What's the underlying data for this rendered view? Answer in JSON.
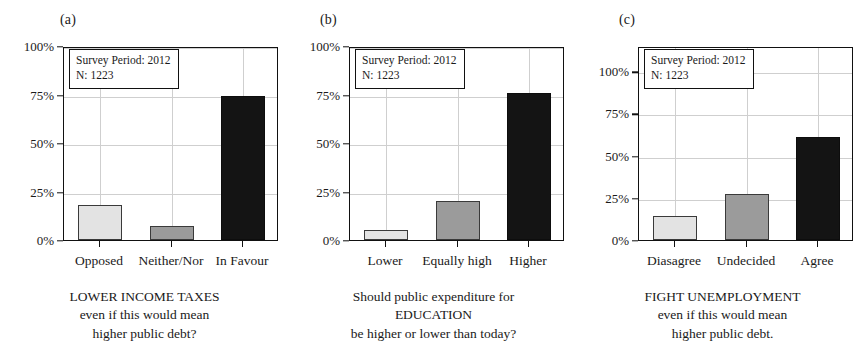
{
  "figure": {
    "panels": [
      {
        "letter": "(a)",
        "annotation": {
          "survey_period": "Survey Period: 2012",
          "n": "N: 1223"
        },
        "y_ticks": [
          "0%",
          "25%",
          "50%",
          "75%",
          "100%"
        ],
        "x_labels": [
          "Opposed",
          "Neither/Nor",
          "In Favour"
        ],
        "caption_lines": [
          "LOWER INCOME TAXES",
          "even if this would mean",
          "higher public debt?"
        ]
      },
      {
        "letter": "(b)",
        "annotation": {
          "survey_period": "Survey Period: 2012",
          "n": "N: 1223"
        },
        "y_ticks": [
          "0%",
          "25%",
          "50%",
          "75%",
          "100%"
        ],
        "x_labels": [
          "Lower",
          "Equally high",
          "Higher"
        ],
        "caption_lines": [
          "Should public expenditure for",
          "EDUCATION",
          "be higher or lower than today?"
        ]
      },
      {
        "letter": "(c)",
        "annotation": {
          "survey_period": "Survey Period: 2012",
          "n": "N: 1223"
        },
        "y_ticks": [
          "0%",
          "25%",
          "50%",
          "75%",
          "100%"
        ],
        "x_labels": [
          "Diasagree",
          "Undecided",
          "Agree"
        ],
        "caption_lines": [
          "FIGHT UNEMPLOYMENT",
          "even if this would mean",
          "higher public debt."
        ]
      }
    ],
    "colors": {
      "bar_light": "#e3e3e3",
      "bar_medium": "#9b9b9b",
      "bar_dark": "#141414",
      "frame": "#111111",
      "grid": "#cfcfcf",
      "text": "#1a1a1a",
      "background": "#ffffff"
    }
  },
  "chart_data": [
    {
      "type": "bar",
      "panel": "(a)",
      "title": "LOWER INCOME TAXES even if this would mean higher public debt?",
      "xlabel": "",
      "ylabel": "",
      "categories": [
        "Opposed",
        "Neither/Nor",
        "In Favour"
      ],
      "values": [
        18,
        7,
        74
      ],
      "bar_colors": [
        "#e3e3e3",
        "#9b9b9b",
        "#141414"
      ],
      "ylim": [
        0,
        100
      ],
      "yticks": [
        0,
        25,
        50,
        75,
        100
      ],
      "ytick_labels": [
        "0%",
        "25%",
        "50%",
        "75%",
        "100%"
      ],
      "grid": true,
      "legend": false,
      "annotations": [
        "Survey Period: 2012",
        "N: 1223"
      ]
    },
    {
      "type": "bar",
      "panel": "(b)",
      "title": "Should public expenditure for EDUCATION be higher or lower than today?",
      "xlabel": "",
      "ylabel": "",
      "categories": [
        "Lower",
        "Equally high",
        "Higher"
      ],
      "values": [
        5,
        20,
        76
      ],
      "bar_colors": [
        "#e3e3e3",
        "#9b9b9b",
        "#141414"
      ],
      "ylim": [
        0,
        100
      ],
      "yticks": [
        0,
        25,
        50,
        75,
        100
      ],
      "ytick_labels": [
        "0%",
        "25%",
        "50%",
        "75%",
        "100%"
      ],
      "grid": true,
      "legend": false,
      "annotations": [
        "Survey Period: 2012",
        "N: 1223"
      ]
    },
    {
      "type": "bar",
      "panel": "(c)",
      "title": "FIGHT UNEMPLOYMENT even if this would mean higher public debt.",
      "xlabel": "",
      "ylabel": "",
      "categories": [
        "Diasagree",
        "Undecided",
        "Agree"
      ],
      "values": [
        14,
        27,
        61
      ],
      "bar_colors": [
        "#e3e3e3",
        "#9b9b9b",
        "#141414"
      ],
      "ylim": [
        0,
        115
      ],
      "yticks": [
        0,
        25,
        50,
        75,
        100
      ],
      "ytick_labels": [
        "0%",
        "25%",
        "50%",
        "75%",
        "100%"
      ],
      "grid": true,
      "legend": false,
      "annotations": [
        "Survey Period: 2012",
        "N: 1223"
      ]
    }
  ]
}
